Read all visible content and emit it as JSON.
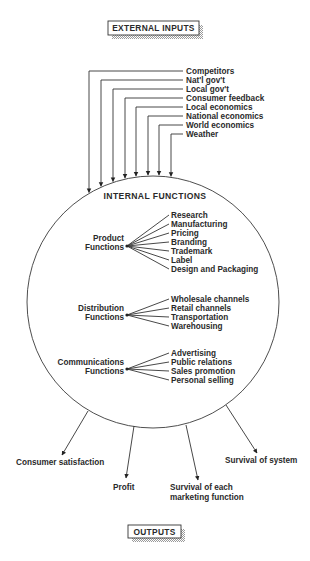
{
  "title_box": {
    "label": "EXTERNAL INPUTS",
    "x": 108,
    "y": 21,
    "w": 91,
    "h": 14
  },
  "inputs": [
    {
      "label": "Competitors",
      "line_y": 71,
      "arrow_x": 89
    },
    {
      "label": "Nat'l gov't",
      "line_y": 80,
      "arrow_x": 101
    },
    {
      "label": "Local gov't",
      "line_y": 89,
      "arrow_x": 113
    },
    {
      "label": "Consumer feedback",
      "line_y": 98,
      "arrow_x": 125
    },
    {
      "label": "Local economics",
      "line_y": 107,
      "arrow_x": 136
    },
    {
      "label": "National economics",
      "line_y": 116,
      "arrow_x": 148
    },
    {
      "label": "World economics",
      "line_y": 125,
      "arrow_x": 159
    },
    {
      "label": "Weather",
      "line_y": 134,
      "arrow_x": 171
    }
  ],
  "circle": {
    "cx": 153,
    "cy": 302,
    "r": 126
  },
  "internal": {
    "heading": "INTERNAL FUNCTIONS",
    "groups": [
      {
        "name": "product",
        "label_lines": [
          "Product",
          "Functions"
        ],
        "label_right_x": 124,
        "label_y": 241,
        "origin": [
          127,
          246
        ],
        "items": [
          "Research",
          "Manufacturing",
          "Pricing",
          "Branding",
          "Trademark",
          "Label",
          "Design and Packaging"
        ],
        "items_start_y": 218
      },
      {
        "name": "distribution",
        "label_lines": [
          "Distribution",
          "Functions"
        ],
        "label_right_x": 124,
        "label_y": 311,
        "origin": [
          127,
          315
        ],
        "items": [
          "Wholesale channels",
          "Retail channels",
          "Transportation",
          "Warehousing"
        ],
        "items_start_y": 302
      },
      {
        "name": "communications",
        "label_lines": [
          "Communications",
          "Functions"
        ],
        "label_right_x": 124,
        "label_y": 365,
        "origin": [
          127,
          369
        ],
        "items": [
          "Advertising",
          "Public relations",
          "Sales promotion",
          "Personal selling"
        ],
        "items_start_y": 356
      }
    ]
  },
  "outputs": [
    {
      "lines": [
        "Consumer satisfaction"
      ],
      "from": [
        88,
        411
      ],
      "to": [
        62,
        455
      ],
      "label_x": 16,
      "label_y": 465,
      "anchor": "start"
    },
    {
      "lines": [
        "Profit"
      ],
      "from": [
        134,
        426
      ],
      "to": [
        126,
        478
      ],
      "label_x": 113,
      "label_y": 490,
      "anchor": "start"
    },
    {
      "lines": [
        "Survival of each",
        "marketing function"
      ],
      "from": [
        186,
        425
      ],
      "to": [
        198,
        480
      ],
      "label_x": 170,
      "label_y": 490,
      "anchor": "start"
    },
    {
      "lines": [
        "Survival of system"
      ],
      "from": [
        226,
        405
      ],
      "to": [
        257,
        453
      ],
      "label_x": 225,
      "label_y": 463,
      "anchor": "start"
    }
  ],
  "bottom_box": {
    "label": "OUTPUTS",
    "x": 128,
    "y": 525,
    "w": 53,
    "h": 13
  },
  "colors": {
    "ink": "#2a2a2a",
    "shadow": "#b8b8b8"
  }
}
